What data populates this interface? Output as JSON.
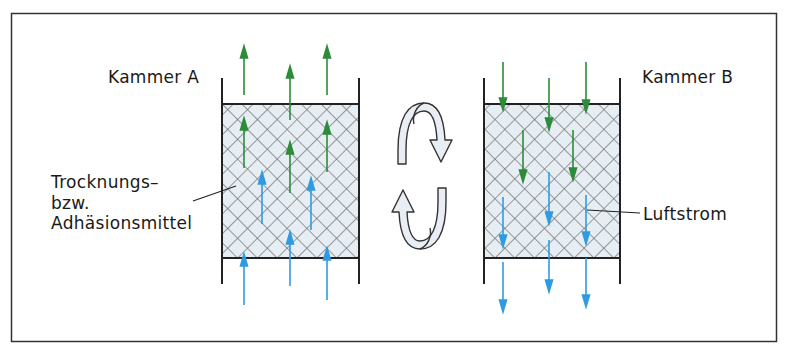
{
  "diagram": {
    "chamber_a": {
      "label": "Kammer A",
      "flow": "upward"
    },
    "chamber_b": {
      "label": "Kammer B",
      "flow": "downward"
    },
    "labels": {
      "medium_line1": "Trocknungs–",
      "medium_line2": "bzw.",
      "medium_line3": "Adhäsionsmittel",
      "airflow": "Luftstrom"
    },
    "switch_icon": "cycle-arrows-icon",
    "colors": {
      "border": "#333333",
      "wall": "#222222",
      "fill": "#e6edf3",
      "hatch": "#6a6a6a",
      "green_arrow": "#2e8b3a",
      "blue_arrow": "#2f9be0",
      "cycle_fill": "#e8eef4"
    }
  }
}
